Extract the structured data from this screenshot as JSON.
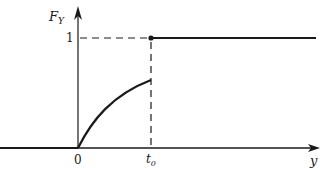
{
  "diagram": {
    "y_axis": {
      "label_main": "F",
      "label_sub": "Y"
    },
    "x_axis": {
      "label": "y"
    },
    "ticks": {
      "y_one": "1",
      "x_zero": "0",
      "x_t0_main": "t",
      "x_t0_sub": "0"
    },
    "colors": {
      "ink": "#1a1a1a",
      "background": "#ffffff"
    },
    "segments": [
      {
        "name": "zero-line",
        "from": "-inf",
        "to": "0",
        "value": "0"
      },
      {
        "name": "rising-curve",
        "from": "0",
        "to": "t0",
        "shape": "concave increasing"
      },
      {
        "name": "jump",
        "at": "t0",
        "to_value": "1",
        "marker": "filled-dot"
      },
      {
        "name": "one-line",
        "from": "t0",
        "to": "+inf",
        "value": "1"
      }
    ]
  }
}
